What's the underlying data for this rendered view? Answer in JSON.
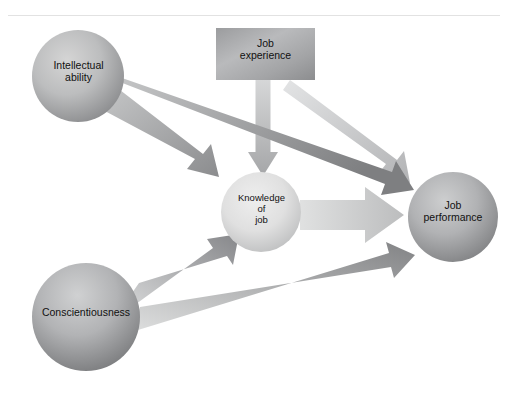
{
  "figure": {
    "type": "path-model-diagram",
    "background_color": "#ffffff",
    "divider_color": "#e2e2e2",
    "width": 508,
    "height": 398
  },
  "nodes": [
    {
      "id": "intellectual-ability",
      "label": "Intellectual\nability",
      "shape": "circle",
      "cx": 78,
      "cy": 76,
      "r": 46,
      "fill_light": "#cfcfcf",
      "fill_dark": "#8f9092"
    },
    {
      "id": "job-experience",
      "label": "Job\nexperience",
      "shape": "rectangle",
      "x": 216,
      "y": 28,
      "w": 99,
      "h": 52,
      "fill_light": "#b4b5b7",
      "fill_dark": "#8e8f91"
    },
    {
      "id": "knowledge-of-job",
      "label": "Knowledge\nof\njob",
      "shape": "circle",
      "cx": 261,
      "cy": 212,
      "r": 40,
      "fill_light": "#e4e4e4",
      "fill_dark": "#c2c3c4"
    },
    {
      "id": "job-performance",
      "label": "Job\nperformance",
      "shape": "circle",
      "cx": 453,
      "cy": 217,
      "r": 45,
      "fill_light": "#c6c7c8",
      "fill_dark": "#868789"
    },
    {
      "id": "conscientiousness",
      "label": "Conscientiousness",
      "shape": "circle",
      "cx": 86,
      "cy": 317,
      "r": 54,
      "fill_light": "#c9cacb",
      "fill_dark": "#7f8082"
    }
  ],
  "edges": [
    {
      "id": "intellectual-to-knowledge",
      "from": "intellectual-ability",
      "to": "knowledge-of-job",
      "color_start": "#bcbdbe",
      "color_end": "#8d8e90",
      "weight": "medium"
    },
    {
      "id": "intellectual-to-performance",
      "from": "intellectual-ability",
      "to": "job-performance",
      "color_start": "#c2c3c4",
      "color_end": "#7f8082",
      "weight": "medium"
    },
    {
      "id": "jobexperience-to-knowledge",
      "from": "job-experience",
      "to": "knowledge-of-job",
      "color_start": "#d3d4d5",
      "color_end": "#a9aaac",
      "weight": "medium"
    },
    {
      "id": "jobexperience-to-performance",
      "from": "job-experience",
      "to": "job-performance",
      "color_start": "#dedfe0",
      "color_end": "#b5b6b8",
      "weight": "medium"
    },
    {
      "id": "knowledge-to-performance",
      "from": "knowledge-of-job",
      "to": "job-performance",
      "color_start": "#dcdddd",
      "color_end": "#c0c1c2",
      "weight": "thick"
    },
    {
      "id": "conscientiousness-to-knowledge",
      "from": "conscientiousness",
      "to": "knowledge-of-job",
      "color_start": "#cccdce",
      "color_end": "#88898b",
      "weight": "medium"
    },
    {
      "id": "conscientiousness-to-performance",
      "from": "conscientiousness",
      "to": "job-performance",
      "color_start": "#d7d8d9",
      "color_end": "#858688",
      "weight": "medium"
    }
  ]
}
